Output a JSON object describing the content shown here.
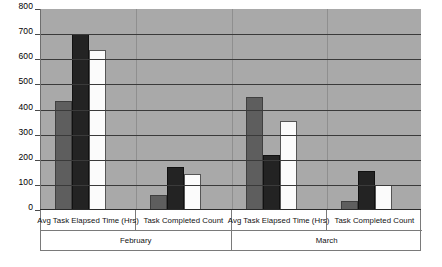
{
  "chart_data": {
    "type": "bar",
    "title": "",
    "subtitle": "",
    "xlabel": "",
    "ylabel": "",
    "ylim": [
      0,
      800
    ],
    "ytick_step": 100,
    "yticks": [
      800,
      700,
      600,
      500,
      400,
      300,
      200,
      100,
      0
    ],
    "grid": true,
    "legend": "none",
    "grouping": "Month > Metric > Series",
    "outer_groups": [
      "February",
      "March"
    ],
    "categories": [
      "Avg Task Elapsed Time (Hrs)",
      "Task Completed Count",
      "Avg Task Elapsed Time (Hrs)",
      "Task Completed Count"
    ],
    "series": [
      {
        "name": "Series 1",
        "color": "#5e5e5e",
        "values": [
          435,
          60,
          450,
          35
        ]
      },
      {
        "name": "Series 2",
        "color": "#232323",
        "values": [
          700,
          170,
          220,
          155
        ]
      },
      {
        "name": "Series 3",
        "color": "#fbfbfb",
        "values": [
          635,
          145,
          355,
          100
        ]
      }
    ],
    "plot_background": "#a9a9a9",
    "gridline_color": "#3a3a3a"
  },
  "axis": {
    "y_labels": [
      "800",
      "700",
      "600",
      "500",
      "400",
      "300",
      "200",
      "100",
      "0"
    ]
  },
  "groups": [
    {
      "label": "February",
      "categories": [
        "Avg Task Elapsed Time (Hrs)",
        "Task Completed Count"
      ]
    },
    {
      "label": "March",
      "categories": [
        "Avg Task Elapsed Time (Hrs)",
        "Task Completed Count"
      ]
    }
  ]
}
